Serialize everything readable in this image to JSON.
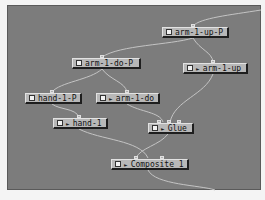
{
  "canvas": {
    "background": "#7c7c7c"
  },
  "nodes": [
    {
      "id": "arm-1-up-P",
      "label": "arm-1-up-P",
      "has_arrow": false
    },
    {
      "id": "arm-1-do-P",
      "label": "arm-1-do-P",
      "has_arrow": false
    },
    {
      "id": "arm-1-up",
      "label": "arm-1-up",
      "has_arrow": true,
      "arrow": "►"
    },
    {
      "id": "hand-1-P",
      "label": "hand-1-P",
      "has_arrow": false
    },
    {
      "id": "arm-1-do",
      "label": "arm-1-do",
      "has_arrow": true,
      "arrow": "►"
    },
    {
      "id": "hand-1",
      "label": "hand-1",
      "has_arrow": true,
      "arrow": "►"
    },
    {
      "id": "Glue",
      "label": "Glue",
      "has_arrow": true,
      "arrow": "►"
    },
    {
      "id": "Composite_1",
      "label": "Composite_1",
      "has_arrow": true,
      "arrow": "►"
    }
  ],
  "edges": [
    [
      "arm-1-up-P",
      "arm-1-do-P"
    ],
    [
      "arm-1-up-P",
      "arm-1-up"
    ],
    [
      "arm-1-do-P",
      "hand-1-P"
    ],
    [
      "arm-1-do-P",
      "arm-1-do"
    ],
    [
      "hand-1-P",
      "hand-1"
    ],
    [
      "arm-1-do",
      "Glue"
    ],
    [
      "arm-1-up",
      "Glue"
    ],
    [
      "hand-1",
      "Composite_1"
    ],
    [
      "Glue",
      "Composite_1"
    ]
  ]
}
